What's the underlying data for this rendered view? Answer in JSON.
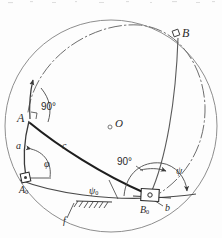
{
  "figure": {
    "type": "geometric-diagram",
    "width": 222,
    "height": 238,
    "background": "#fdfdfd",
    "ink_color": "#3a3a3a",
    "bold_ink_color": "#1e1e1e"
  },
  "labels": {
    "point_A": "A",
    "point_B": "B",
    "point_O": "O",
    "point_A0_main": "A",
    "point_A0_sub": "0",
    "point_B0_main": "B",
    "point_B0_sub": "0",
    "link_a": "a",
    "link_b": "b",
    "link_c": "c",
    "frame_f": "f",
    "angle_phi": "φ",
    "angle_psi": "ψ",
    "angle_psi0_main": "ψ",
    "angle_psi0_sub": "0",
    "right_angle_A": "90°",
    "right_angle_B0": "90°"
  },
  "elements": {
    "sphere_outline": "outer-circle",
    "great_circle_arc": "dash-dot-arc",
    "coupler_arc": "arc-A-to-B0",
    "crank_arc_a": "arc-A0-to-A",
    "follower_arc_b": "arc-B0-to-B",
    "ground_arc_f": "arc-A0-to-B0",
    "hatching": "ground-hatch",
    "joint_A0": "square-joint",
    "joint_B0": "slider-block",
    "center_marker_O": "center-dot"
  },
  "geometry": {
    "sphere_center_x": 111,
    "sphere_center_y": 126,
    "sphere_radius": 106,
    "A": [
      29,
      120
    ],
    "B": [
      178,
      34
    ],
    "A0": [
      27,
      179
    ],
    "B0": [
      150,
      197
    ],
    "O": [
      110,
      126
    ]
  }
}
